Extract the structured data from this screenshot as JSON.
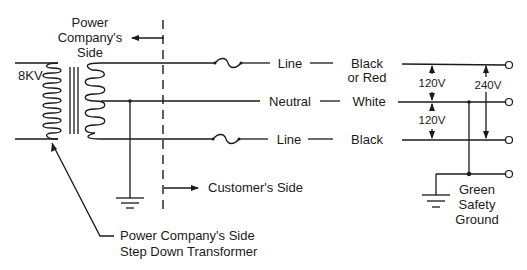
{
  "diagram": {
    "labels": {
      "power_company_side": [
        "Power",
        "Company's",
        "Side"
      ],
      "primary_voltage": "8KV",
      "customer_side": "Customer's Side",
      "transformer_callout": [
        "Power Company's Side",
        "Step Down Transformer"
      ],
      "wire_line_top": "Line",
      "wire_neutral": "Neutral",
      "wire_line_bottom": "Line",
      "color_top": [
        "Black",
        "or Red"
      ],
      "color_neutral": "White",
      "color_bottom": "Black",
      "voltage_top_neutral": "120V",
      "voltage_neutral_bottom": "120V",
      "voltage_line_line": "240V",
      "ground_label": [
        "Green",
        "Safety",
        "Ground"
      ]
    },
    "colors": {
      "ink": "#1a1a1a",
      "background": "#ffffff"
    }
  }
}
